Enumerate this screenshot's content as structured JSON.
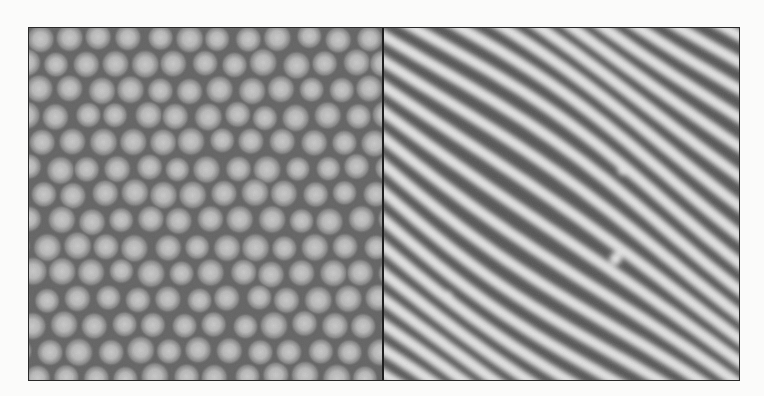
{
  "figure": {
    "panels": [
      {
        "id": "left",
        "pattern": "hexagonal-spot-lattice",
        "background_color": "#5a5a5a",
        "spot_color": "#ececec",
        "spot_spacing_px": 30,
        "row_spacing_px": 26,
        "spot_radius_px": 10
      },
      {
        "id": "right",
        "pattern": "labyrinthine-stripes",
        "dark_color": "#525252",
        "light_color": "#e2e2e2",
        "stripe_period_px": 22,
        "stripe_angle_deg": 35
      }
    ],
    "border_color": "#2a2a2a",
    "divider_color": "#1e1e1e"
  }
}
